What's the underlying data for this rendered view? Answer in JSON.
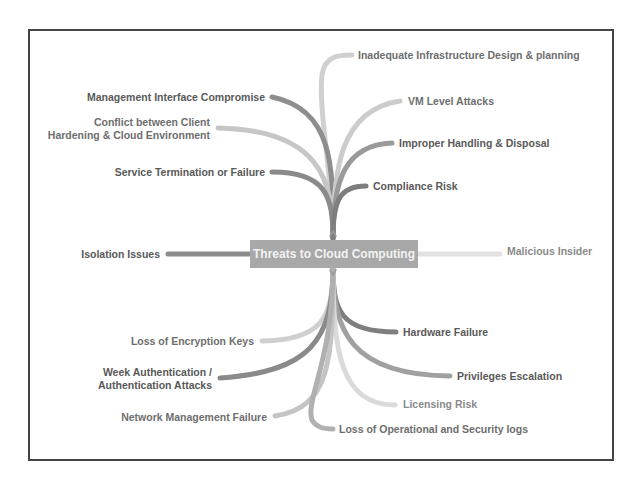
{
  "diagram": {
    "type": "mind-map",
    "central_topic": "Threats to Cloud Computing",
    "branches_top_left": [
      {
        "label": "Management Interface Compromise"
      },
      {
        "label": "Conflict between Client",
        "label2": "Hardening & Cloud Environment"
      },
      {
        "label": "Service Termination or Failure"
      }
    ],
    "branches_top_right": [
      {
        "label": "Inadequate Infrastructure Design & planning"
      },
      {
        "label": "VM Level Attacks"
      },
      {
        "label": "Improper Handling & Disposal"
      },
      {
        "label": "Compliance Risk"
      }
    ],
    "branch_left": {
      "label": "Isolation Issues"
    },
    "branch_right": {
      "label": "Malicious Insider"
    },
    "branches_bottom_left": [
      {
        "label": "Loss of Encryption Keys"
      },
      {
        "label": "Week Authentication /",
        "label2": "Authentication Attacks"
      },
      {
        "label": "Network Management Failure"
      }
    ],
    "branches_bottom_right": [
      {
        "label": "Hardware Failure"
      },
      {
        "label": "Privileges Escalation"
      },
      {
        "label": "Licensing Risk"
      },
      {
        "label": "Loss of Operational and Security logs"
      }
    ],
    "colors": {
      "frame": "#444444",
      "center_bg": "#a8a8a8",
      "center_text": "#f2f2f2",
      "branch_dark": "#8c8c8c",
      "branch_mid": "#a8a8a8",
      "branch_light": "#cfcfcf"
    }
  }
}
